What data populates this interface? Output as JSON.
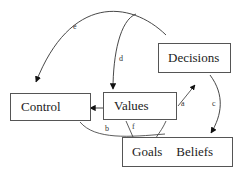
{
  "nodes": {
    "control": {
      "label": "Control"
    },
    "values": {
      "label": "Values"
    },
    "decisions": {
      "label": "Decisions"
    },
    "goals_beliefs": {
      "goals": "Goals",
      "beliefs": "Beliefs"
    }
  },
  "edges": [
    {
      "id": "a",
      "label": "a",
      "from": "Values",
      "to": "Decisions"
    },
    {
      "id": "b",
      "label": "b",
      "from": "Control",
      "to": "Goals Beliefs"
    },
    {
      "id": "c",
      "label": "c",
      "from": "Decisions",
      "to": "Beliefs"
    },
    {
      "id": "d",
      "label": "d",
      "from": "Decisions",
      "to": "Values"
    },
    {
      "id": "e",
      "label": "e",
      "from": "Decisions",
      "to": "Control"
    },
    {
      "id": "f",
      "label": "f",
      "from": "Values",
      "to": "Goals"
    },
    {
      "id": "vc",
      "label": "",
      "from": "Values",
      "to": "Control"
    }
  ],
  "colors": {
    "line": "#333333",
    "box_border": "#555555",
    "background": "#ffffff"
  }
}
